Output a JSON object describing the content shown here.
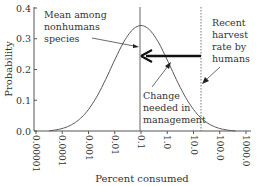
{
  "chart_data": {
    "type": "line",
    "title": "",
    "xlabel": "Percent consumed",
    "ylabel": "Probability",
    "x_scale": "log",
    "x_ticks": [
      "0.00001",
      "0.0001",
      "0.001",
      "0.01",
      "0.1",
      "1.0",
      "10.0",
      "100.0",
      "1000.0"
    ],
    "y_ticks": [
      "0.0",
      "0.1",
      "0.2",
      "0.3",
      "0.4"
    ],
    "ylim": [
      0,
      0.4
    ],
    "xlim": [
      1e-05,
      1000
    ],
    "grid": false,
    "series": [
      {
        "name": "Distribution of consumption among nonhuman species",
        "x": [
          3e-05,
          0.0001,
          0.001,
          0.01,
          0.05,
          0.1,
          0.2,
          1.0,
          10.0,
          100.0,
          400.0
        ],
        "values": [
          0.0,
          0.01,
          0.06,
          0.23,
          0.33,
          0.345,
          0.33,
          0.22,
          0.06,
          0.01,
          0.0
        ]
      }
    ],
    "reference_lines": [
      {
        "name": "mean",
        "x": 0.1,
        "style": "solid"
      },
      {
        "name": "recent-harvest",
        "x": 13.0,
        "style": "dotted"
      }
    ],
    "annotations": [
      {
        "text": "Mean among nonhumans species",
        "lines": [
          "Mean among",
          "nonhumans",
          "species"
        ]
      },
      {
        "text": "Recent harvest rate by humans",
        "lines": [
          "Recent",
          "harvest",
          "rate by",
          "humans"
        ]
      },
      {
        "text": "Change needed in management",
        "lines": [
          "Change",
          "needed in",
          "management"
        ]
      }
    ],
    "arrow": {
      "from_x": 13.0,
      "to_x": 0.1,
      "y": 0.24,
      "label": "Change needed in management"
    }
  }
}
